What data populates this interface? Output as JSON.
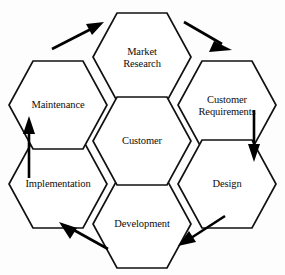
{
  "diagram": {
    "background_color": "#fdfdfd",
    "shape_fill": "#ffffff",
    "stroke_color": "#111111",
    "text_color": "#0d0d0d",
    "shape": "hexagon",
    "nodes": [
      {
        "id": "market-research",
        "label": "Market\nResearch",
        "position": "top",
        "cx": 142,
        "cy": 57,
        "rx": 49,
        "ry": 48
      },
      {
        "id": "customer-requirements",
        "label": "Customer\nRequirements",
        "position": "top-right",
        "cx": 227,
        "cy": 105,
        "rx": 49,
        "ry": 48
      },
      {
        "id": "design",
        "label": "Design",
        "position": "bottom-right",
        "cx": 227,
        "cy": 184,
        "rx": 49,
        "ry": 48
      },
      {
        "id": "development",
        "label": "Development",
        "position": "bottom",
        "cx": 142,
        "cy": 224,
        "rx": 49,
        "ry": 48
      },
      {
        "id": "implementation",
        "label": "Implementation",
        "position": "bottom-left",
        "cx": 58,
        "cy": 184,
        "rx": 49,
        "ry": 48
      },
      {
        "id": "maintenance",
        "label": "Maintenance",
        "position": "top-left",
        "cx": 58,
        "cy": 105,
        "rx": 49,
        "ry": 48
      },
      {
        "id": "customer",
        "label": "Customer",
        "position": "center",
        "cx": 142,
        "cy": 141,
        "rx": 49,
        "ry": 48
      }
    ],
    "arrows": [
      {
        "id": "maintenance-to-market-research",
        "from": "maintenance",
        "to": "market-research",
        "direction": "up-right"
      },
      {
        "id": "market-research-to-customer-requirements",
        "from": "market-research",
        "to": "customer-requirements",
        "direction": "down-right"
      },
      {
        "id": "customer-requirements-to-design",
        "from": "customer-requirements",
        "to": "design",
        "direction": "down"
      },
      {
        "id": "design-to-development",
        "from": "design",
        "to": "development",
        "direction": "down-left"
      },
      {
        "id": "development-to-implementation",
        "from": "development",
        "to": "implementation",
        "direction": "up-left"
      },
      {
        "id": "implementation-to-maintenance",
        "from": "implementation",
        "to": "maintenance",
        "direction": "up"
      }
    ]
  }
}
